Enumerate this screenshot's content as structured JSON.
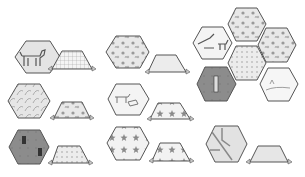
{
  "colors": {
    "background": "#ffffff",
    "outline": "#555555",
    "light_fabric": "#eeeeee",
    "mid_fabric": "#d9d9d9",
    "dark_fabric": "#8a8a8a",
    "print": "#9a9a9a"
  },
  "pairs": [
    {
      "id": "pair-1",
      "hexagon": {
        "cx": 38,
        "cy": 55,
        "fabric": "animal-print"
      },
      "trapezoid": {
        "x": 48,
        "y": 48,
        "fabric": "grid"
      }
    },
    {
      "id": "pair-2",
      "hexagon": {
        "cx": 128,
        "cy": 52,
        "fabric": "floral"
      },
      "trapezoid": {
        "x": 148,
        "y": 56,
        "fabric": "light-texture"
      }
    },
    {
      "id": "pair-3",
      "hexagon": {
        "cx": 28,
        "cy": 101,
        "fabric": "leaf-print"
      },
      "trapezoid": {
        "x": 53,
        "y": 100,
        "fabric": "light-floral"
      }
    },
    {
      "id": "pair-4",
      "hexagon": {
        "cx": 128,
        "cy": 98,
        "fabric": "animal-scene"
      },
      "trapezoid": {
        "x": 150,
        "y": 102,
        "fabric": "star-print"
      }
    },
    {
      "id": "pair-5",
      "hexagon": {
        "cx": 28,
        "cy": 148,
        "fabric": "dark-figures"
      },
      "trapezoid": {
        "x": 48,
        "y": 146,
        "fabric": "dotted"
      }
    },
    {
      "id": "pair-6",
      "hexagon": {
        "cx": 128,
        "cy": 142,
        "fabric": "star-print"
      },
      "trapezoid": {
        "x": 152,
        "y": 144,
        "fabric": "star-print"
      }
    },
    {
      "id": "pair-7",
      "hexagon": {
        "cx": 227,
        "cy": 145,
        "fabric": "scene"
      },
      "trapezoid": {
        "x": 246,
        "y": 148,
        "fabric": "light-texture"
      }
    }
  ],
  "cluster": {
    "hexagons": [
      {
        "cx": 212,
        "cy": 42,
        "fabric": "animal-scene"
      },
      {
        "cx": 246,
        "cy": 24,
        "fabric": "floral"
      },
      {
        "cx": 276,
        "cy": 45,
        "fabric": "floral"
      },
      {
        "cx": 246,
        "cy": 64,
        "fabric": "light-floral"
      },
      {
        "cx": 216,
        "cy": 84,
        "fabric": "dark-figure"
      },
      {
        "cx": 278,
        "cy": 84,
        "fabric": "animal-scene"
      }
    ]
  }
}
